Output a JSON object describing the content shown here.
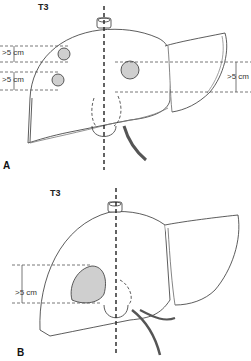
{
  "figure": {
    "panels": [
      {
        "id": "A",
        "panel_label": "A",
        "title": "T3",
        "measurements": [
          {
            "label": ">5 cm",
            "side": "left",
            "tumor": "upper-left nodule"
          },
          {
            "label": ">5 cm",
            "side": "left",
            "tumor": "lower-left nodule"
          },
          {
            "label": ">5 cm",
            "side": "right",
            "tumor": "central-right nodule"
          }
        ]
      },
      {
        "id": "B",
        "panel_label": "B",
        "title": "T3",
        "measurements": [
          {
            "label": ">5 cm",
            "side": "left",
            "tumor": "large lobulated mass"
          }
        ]
      }
    ],
    "colors": {
      "line": "#333333",
      "background": "#ffffff",
      "tumor_fill": "#cfcfcf"
    }
  }
}
